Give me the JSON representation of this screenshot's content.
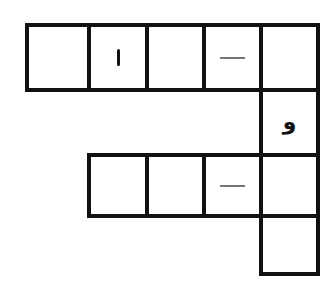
{
  "puzzle": {
    "type": "word-grid",
    "row1": {
      "cells": [
        {
          "content": ""
        },
        {
          "content": "ا"
        },
        {
          "content": ""
        },
        {
          "content": "—"
        },
        {
          "content": ""
        }
      ]
    },
    "row2": {
      "cells": [
        {
          "content": "و"
        }
      ]
    },
    "row3": {
      "cells": [
        {
          "content": ""
        },
        {
          "content": ""
        },
        {
          "content": "—"
        },
        {
          "content": ""
        }
      ]
    },
    "row4": {
      "cells": [
        {
          "content": ""
        }
      ]
    }
  },
  "colors": {
    "border": "#111111",
    "dash": "#777777",
    "background": "#ffffff"
  }
}
